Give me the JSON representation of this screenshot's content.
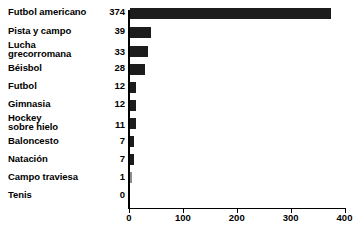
{
  "chart_data": {
    "type": "bar",
    "orientation": "horizontal",
    "title": "",
    "subtitle": "",
    "xlabel": "",
    "ylabel": "",
    "grid": false,
    "legend": "none",
    "xlim": [
      0,
      400
    ],
    "xticks": [
      0,
      100,
      200,
      300,
      400
    ],
    "xtick_labels": [
      "0",
      "100",
      "200",
      "300",
      "400"
    ],
    "categories": [
      "Futbol americano",
      "Pista y campo",
      "Lucha grecorromana",
      "Béisbol",
      "Futbol",
      "Gimnasia",
      "Hockey sobre hielo",
      "Baloncesto",
      "Natación",
      "Campo traviesa",
      "Tenis"
    ],
    "values": [
      374,
      39,
      33,
      28,
      12,
      12,
      11,
      7,
      7,
      1,
      0
    ],
    "bar_color": "#1c1c1c",
    "minor_bar_color": "#8d8d8d",
    "axis_color": "#000000",
    "background": "#ffffff"
  },
  "rows": [
    {
      "label": "Futbol americano",
      "label_lines": "Futbol americano",
      "value": "374",
      "value_num": 374,
      "two_line": false,
      "light": false
    },
    {
      "label": "Pista y campo",
      "label_lines": "Pista y campo",
      "value": "39",
      "value_num": 39,
      "two_line": false,
      "light": false
    },
    {
      "label": "Lucha grecorromana",
      "label_lines": "Lucha\ngrecorromana",
      "value": "33",
      "value_num": 33,
      "two_line": true,
      "light": false
    },
    {
      "label": "Béisbol",
      "label_lines": "Béisbol",
      "value": "28",
      "value_num": 28,
      "two_line": false,
      "light": false
    },
    {
      "label": "Futbol",
      "label_lines": "Futbol",
      "value": "12",
      "value_num": 12,
      "two_line": false,
      "light": false
    },
    {
      "label": "Gimnasia",
      "label_lines": "Gimnasia",
      "value": "12",
      "value_num": 12,
      "two_line": false,
      "light": false
    },
    {
      "label": "Hockey sobre hielo",
      "label_lines": "Hockey\nsobre hielo",
      "value": "11",
      "value_num": 11,
      "two_line": true,
      "light": false
    },
    {
      "label": "Baloncesto",
      "label_lines": "Baloncesto",
      "value": "7",
      "value_num": 7,
      "two_line": false,
      "light": false
    },
    {
      "label": "Natación",
      "label_lines": "Natación",
      "value": "7",
      "value_num": 7,
      "two_line": false,
      "light": false
    },
    {
      "label": "Campo traviesa",
      "label_lines": "Campo traviesa",
      "value": "1",
      "value_num": 1,
      "two_line": false,
      "light": true
    },
    {
      "label": "Tenis",
      "label_lines": "Tenis",
      "value": "0",
      "value_num": 0,
      "two_line": false,
      "light": false
    }
  ],
  "axis": {
    "ticks": [
      {
        "label": "0",
        "value": 0
      },
      {
        "label": "100",
        "value": 100
      },
      {
        "label": "200",
        "value": 200
      },
      {
        "label": "300",
        "value": 300
      },
      {
        "label": "400",
        "value": 400
      }
    ]
  }
}
